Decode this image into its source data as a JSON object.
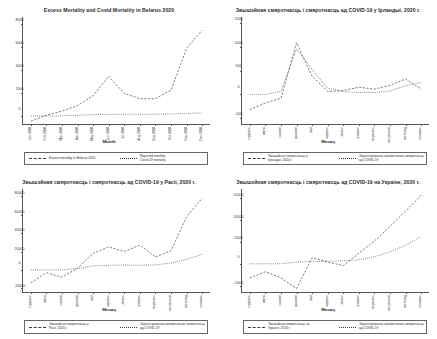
{
  "figure": {
    "panel_count": 4,
    "background": "#ffffff",
    "line_color": "#3a3a3a"
  },
  "chart_data": [
    {
      "type": "line",
      "panel": "top-left",
      "title": "Excess Mortality and Covid Mortality in Belarus 2020",
      "xlabel": "Month",
      "ylabel": "",
      "categories": [
        "січень",
        "лютий",
        "березень",
        "квітень",
        "травень",
        "червень",
        "липень",
        "серпень",
        "вересень",
        "жовтень",
        "листопад",
        "грудень"
      ],
      "tick_labels": [
        "Jan 2020",
        "Feb 2020",
        "Mar 2020",
        "Apr 2020",
        "May 2020",
        "Jun 2020",
        "Jul 2020",
        "Aug 2020",
        "Sep 2020",
        "Oct 2020",
        "Nov 2020",
        "Dec 2020"
      ],
      "yticks": [
        0,
        2000,
        4000,
        6000,
        8000
      ],
      "ylim": [
        -700,
        8600
      ],
      "grid": false,
      "legend_position": "below",
      "series": [
        {
          "name": "Excess mortality in Belarus 2020",
          "style": "dashed",
          "values": [
            -450,
            60,
            420,
            900,
            1750,
            3450,
            1950,
            1500,
            1500,
            2250,
            5900,
            7450
          ]
        },
        {
          "name": "Reported monthly Covid-19 mortality",
          "style": "dotted",
          "values": [
            0,
            0,
            5,
            60,
            120,
            140,
            150,
            150,
            150,
            170,
            210,
            260
          ]
        }
      ]
    },
    {
      "type": "line",
      "panel": "top-right",
      "title": "Звышэйная смяротнасць і смяротнасць ад COVID-19 у Ірландыі, 2020 г.",
      "xlabel": "Месяц",
      "ylabel": "",
      "tick_labels": [
        "студзень",
        "люты",
        "сакавік",
        "красавік",
        "май",
        "чэрвень",
        "ліпень",
        "жнівень",
        "верасень",
        "кастрычнік",
        "лістапад",
        "снежань"
      ],
      "yticks": [
        -500,
        0,
        500,
        1000,
        1500
      ],
      "ylim": [
        -620,
        1620
      ],
      "grid": false,
      "legend_position": "below",
      "series": [
        {
          "name": "Звышэйная смяротнасць у Ірландыі, 2020 г.",
          "style": "dashed",
          "values": [
            -320,
            -180,
            -80,
            1080,
            380,
            60,
            80,
            150,
            110,
            190,
            320,
            110
          ]
        },
        {
          "name": "Зарэгістраваная штомесячная смяротнасць ад COVID-19",
          "style": "dotted",
          "values": [
            0,
            0,
            60,
            950,
            520,
            130,
            60,
            40,
            40,
            70,
            180,
            250
          ]
        }
      ]
    },
    {
      "type": "line",
      "panel": "bottom-left",
      "title": "Звышэйная смяротнасць і смяротнасць ад COVID-19 у Расіі, 2020 г.",
      "xlabel": "Месяц",
      "ylabel": "",
      "tick_labels": [
        "студзень",
        "люты",
        "сакавік",
        "красавік",
        "май",
        "чэрвень",
        "ліпень",
        "жнівень",
        "верасень",
        "кастрычнік",
        "лістапад",
        "снежань"
      ],
      "yticks": [
        -20000,
        0,
        20000,
        40000,
        60000,
        80000
      ],
      "ylim": [
        -24000,
        88000
      ],
      "grid": false,
      "legend_position": "below",
      "series": [
        {
          "name": "Звышэйная смяротнасць у Расіі, 2020 г.",
          "style": "dashed",
          "values": [
            -14000,
            -3000,
            -8000,
            2000,
            18000,
            25000,
            20000,
            27000,
            14000,
            21000,
            58000,
            78000
          ]
        },
        {
          "name": "Зарэгістраваная штомесячная смяротнасць ад COVID-19",
          "style": "dotted",
          "values": [
            0,
            0,
            100,
            1500,
            4500,
            4900,
            5400,
            5000,
            5500,
            7500,
            11500,
            17000
          ]
        }
      ]
    },
    {
      "type": "line",
      "panel": "bottom-right",
      "title": "Звышэйная смяротнасць і смяротнасць ад COVID-19 на Украіне, 2020 г.",
      "xlabel": "Месяц",
      "ylabel": "",
      "tick_labels": [
        "студзень",
        "люты",
        "сакавік",
        "красавік",
        "май",
        "чэрвень",
        "ліпень",
        "жнівень",
        "верасень",
        "кастрычнік",
        "лістапад",
        "снежань"
      ],
      "yticks": [
        -5000,
        0,
        5000,
        10000,
        15000
      ],
      "ylim": [
        -6400,
        17000
      ],
      "grid": false,
      "legend_position": "below",
      "series": [
        {
          "name": "Звышэйная смяротнасць на Украіне, 2020 г.",
          "style": "dashed",
          "values": [
            -3200,
            -1800,
            -3200,
            -5600,
            1400,
            400,
            -400,
            2400,
            5200,
            8500,
            12000,
            15600
          ]
        },
        {
          "name": "Зарэгістраваная штомесячная смяротнасць ад COVID-19",
          "style": "dotted",
          "values": [
            0,
            0,
            20,
            400,
            500,
            600,
            700,
            900,
            1600,
            2700,
            4200,
            6200
          ]
        }
      ]
    }
  ]
}
